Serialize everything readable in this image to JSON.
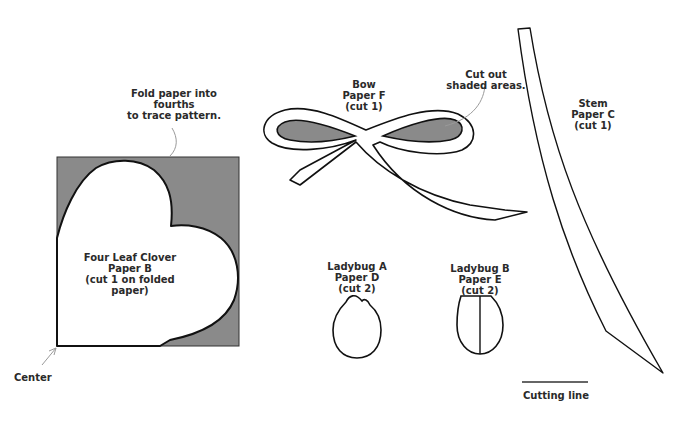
{
  "colors": {
    "shade": "#8a8a8a",
    "line": "#111111",
    "leader": "#9a9a9a",
    "background": "#ffffff"
  },
  "annotations": {
    "fold": [
      "Fold paper into",
      "fourths",
      "to trace pattern."
    ],
    "center": "Center",
    "cut_shaded": [
      "Cut out",
      "shaded areas."
    ],
    "legend_cutting_line": "Cutting line"
  },
  "pieces": {
    "clover": {
      "name": "Four Leaf Clover",
      "paper": "Paper B",
      "instructions": [
        "(cut 1 on folded",
        "paper)"
      ]
    },
    "bow": {
      "name": "Bow",
      "paper": "Paper F",
      "instructions": "(cut 1)"
    },
    "stem": {
      "name": "Stem",
      "paper": "Paper C",
      "instructions": "(cut 1)"
    },
    "ladybug_a": {
      "name": "Ladybug A",
      "paper": "Paper D",
      "instructions": "(cut 2)"
    },
    "ladybug_b": {
      "name": "Ladybug B",
      "paper": "Paper E",
      "instructions": "(cut 2)"
    }
  }
}
